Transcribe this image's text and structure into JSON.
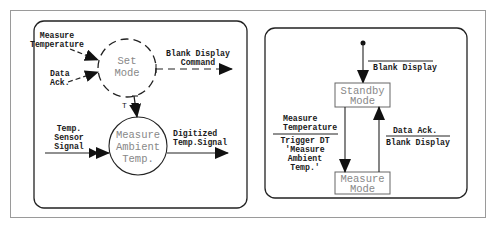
{
  "diagram": {
    "left_panel": {
      "title": "Data/control flow diagram",
      "processes": [
        {
          "id": "set_mode",
          "lines": [
            "Set",
            "Mode"
          ],
          "style": "dashed-circle",
          "type": "control"
        },
        {
          "id": "measure_ambient_temp",
          "lines": [
            "Measure",
            "Ambient",
            "Temp."
          ],
          "style": "solid-circle",
          "type": "data"
        }
      ],
      "flows": [
        {
          "id": "measure_temperature",
          "lines": [
            "Measure",
            "Temperature"
          ],
          "to": "set_mode",
          "style": "dashed"
        },
        {
          "id": "data_ack",
          "lines": [
            "Data",
            "Ack."
          ],
          "to": "set_mode",
          "style": "dashed"
        },
        {
          "id": "blank_display_command",
          "lines": [
            "Blank Display",
            "Command"
          ],
          "from": "set_mode",
          "style": "dashed"
        },
        {
          "id": "trigger",
          "lines": [
            "T"
          ],
          "from": "set_mode",
          "to": "measure_ambient_temp",
          "style": "trigger"
        },
        {
          "id": "temp_sensor_signal",
          "lines": [
            "Temp.",
            "Sensor",
            "Signal"
          ],
          "to": "measure_ambient_temp",
          "style": "solid-double-arrow"
        },
        {
          "id": "digitized_temp_signal",
          "lines": [
            "Digitized",
            "Temp.Signal"
          ],
          "from": "measure_ambient_temp",
          "style": "solid"
        }
      ]
    },
    "right_panel": {
      "title": "State transition diagram",
      "states": [
        {
          "id": "standby",
          "lines": [
            "Standby",
            "Mode"
          ]
        },
        {
          "id": "measure",
          "lines": [
            "Measure",
            "Mode"
          ]
        }
      ],
      "transitions": [
        {
          "id": "initial",
          "from": "start",
          "to": "standby",
          "event": "",
          "action": "Blank Display"
        },
        {
          "id": "standby_to_measure",
          "from": "standby",
          "to": "measure",
          "event": "Measure Temperature",
          "action_lines": [
            "Trigger DT",
            "'Measure",
            "Ambient",
            "Temp.'"
          ]
        },
        {
          "id": "measure_to_standby",
          "from": "measure",
          "to": "standby",
          "event": "Data Ack.",
          "action": "Blank Display"
        }
      ]
    },
    "colors": {
      "line": "#1a1a1a",
      "frame": "#9a9a9a",
      "node_text": "#888888"
    }
  }
}
